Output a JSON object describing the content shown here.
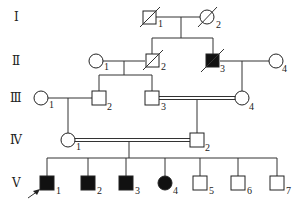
{
  "diagram": {
    "type": "pedigree",
    "generations": [
      {
        "label": "Ⅰ",
        "y": 17
      },
      {
        "label": "Ⅱ",
        "y": 61
      },
      {
        "label": "Ⅲ",
        "y": 98
      },
      {
        "label": "Ⅳ",
        "y": 140
      },
      {
        "label": "Ⅴ",
        "y": 183
      }
    ],
    "individuals": [
      {
        "id": "I-1",
        "num": "1",
        "sex": "male",
        "affected": false,
        "deceased": true,
        "x": 149,
        "y": 17
      },
      {
        "id": "I-2",
        "num": "2",
        "sex": "female",
        "affected": false,
        "deceased": true,
        "x": 207,
        "y": 17
      },
      {
        "id": "II-1",
        "num": "1",
        "sex": "female",
        "affected": false,
        "deceased": false,
        "x": 96,
        "y": 61
      },
      {
        "id": "II-2",
        "num": "2",
        "sex": "male",
        "affected": false,
        "deceased": true,
        "x": 152,
        "y": 61
      },
      {
        "id": "II-3",
        "num": "3",
        "sex": "male",
        "affected": true,
        "deceased": true,
        "x": 213,
        "y": 61
      },
      {
        "id": "II-4",
        "num": "4",
        "sex": "female",
        "affected": false,
        "deceased": false,
        "x": 276,
        "y": 61
      },
      {
        "id": "III-1",
        "num": "1",
        "sex": "female",
        "affected": false,
        "deceased": false,
        "x": 41,
        "y": 98
      },
      {
        "id": "III-2",
        "num": "2",
        "sex": "male",
        "affected": false,
        "deceased": false,
        "x": 99,
        "y": 98
      },
      {
        "id": "III-3",
        "num": "3",
        "sex": "male",
        "affected": false,
        "deceased": false,
        "x": 152,
        "y": 98
      },
      {
        "id": "III-4",
        "num": "4",
        "sex": "female",
        "affected": false,
        "deceased": false,
        "x": 242,
        "y": 98
      },
      {
        "id": "IV-1",
        "num": "1",
        "sex": "female",
        "affected": false,
        "deceased": false,
        "x": 68,
        "y": 140
      },
      {
        "id": "IV-2",
        "num": "2",
        "sex": "male",
        "affected": false,
        "deceased": false,
        "x": 197,
        "y": 140
      },
      {
        "id": "V-1",
        "num": "1",
        "sex": "male",
        "affected": true,
        "deceased": false,
        "proband": true,
        "x": 47,
        "y": 183
      },
      {
        "id": "V-2",
        "num": "2",
        "sex": "male",
        "affected": true,
        "deceased": false,
        "x": 88,
        "y": 183
      },
      {
        "id": "V-3",
        "num": "3",
        "sex": "male",
        "affected": true,
        "deceased": false,
        "x": 126,
        "y": 183
      },
      {
        "id": "V-4",
        "num": "4",
        "sex": "female",
        "affected": true,
        "deceased": false,
        "x": 165,
        "y": 183
      },
      {
        "id": "V-5",
        "num": "5",
        "sex": "male",
        "affected": false,
        "deceased": false,
        "x": 200,
        "y": 183
      },
      {
        "id": "V-6",
        "num": "6",
        "sex": "male",
        "affected": false,
        "deceased": false,
        "x": 238,
        "y": 183
      },
      {
        "id": "V-7",
        "num": "7",
        "sex": "male",
        "affected": false,
        "deceased": false,
        "x": 277,
        "y": 183
      }
    ],
    "unions": [
      {
        "partners": [
          "I-1",
          "I-2"
        ],
        "consanguineous": false
      },
      {
        "partners": [
          "II-1",
          "II-2"
        ],
        "consanguineous": false
      },
      {
        "partners": [
          "II-3",
          "II-4"
        ],
        "consanguineous": false
      },
      {
        "partners": [
          "III-1",
          "III-2"
        ],
        "consanguineous": false
      },
      {
        "partners": [
          "III-3",
          "III-4"
        ],
        "consanguineous": true
      },
      {
        "partners": [
          "IV-1",
          "IV-2"
        ],
        "consanguineous": true
      }
    ],
    "proband_marker": "arrow"
  }
}
